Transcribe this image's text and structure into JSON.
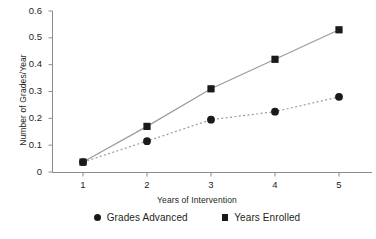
{
  "chart_data": {
    "type": "line",
    "title": "",
    "subtitle": "",
    "xlabel": "Years of Intervention",
    "ylabel": "Number of Grades/Year",
    "x": [
      1,
      2,
      3,
      4,
      5
    ],
    "xticklabels": [
      "1",
      "2",
      "3",
      "4",
      "5"
    ],
    "yticklabels": [
      "0",
      "0.1",
      "0.2",
      "0.3",
      "0.4",
      "0.5",
      "0.6"
    ],
    "yticks": [
      0,
      0.1,
      0.2,
      0.3,
      0.4,
      0.5,
      0.6
    ],
    "xlim": [
      0.5,
      5.45
    ],
    "ylim": [
      0,
      0.6
    ],
    "grid": false,
    "legend_position": "bottom",
    "series": [
      {
        "name": "Grades Advanced",
        "marker": "circle",
        "linestyle": "dotted",
        "color": "#9b9b9b",
        "marker_color": "#1a1a1a",
        "values": [
          0.037,
          0.115,
          0.195,
          0.225,
          0.28
        ]
      },
      {
        "name": "Years Enrolled",
        "marker": "square",
        "linestyle": "solid",
        "color": "#9b9b9b",
        "marker_color": "#1a1a1a",
        "values": [
          0.037,
          0.17,
          0.31,
          0.42,
          0.53
        ]
      }
    ]
  },
  "axes": {
    "axis_color": "#8c8c8c"
  },
  "legend": {
    "entries": [
      {
        "label": "Grades Advanced",
        "marker": "circle"
      },
      {
        "label": "Years Enrolled",
        "marker": "square"
      }
    ]
  }
}
